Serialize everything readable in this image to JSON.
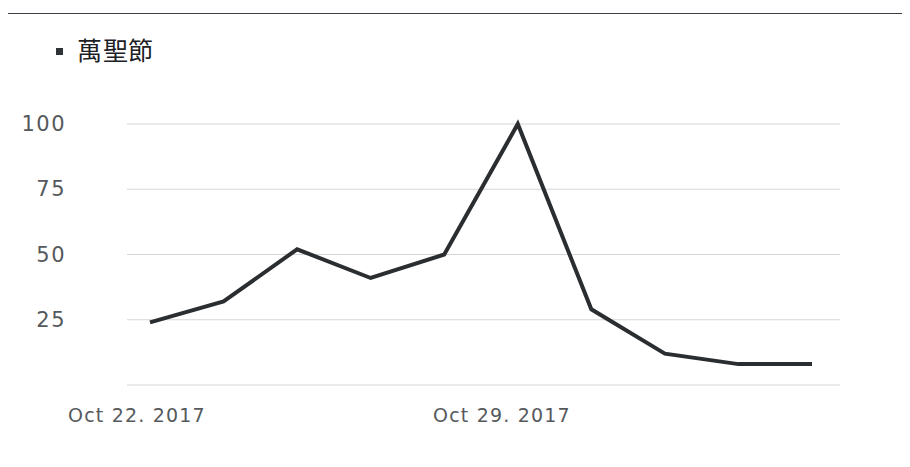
{
  "legend": {
    "marker_icon": "square-marker-icon",
    "label": "萬聖節",
    "color": "#2f3336"
  },
  "axis": {
    "y_ticks": [
      "100",
      "75",
      "50",
      "25"
    ],
    "x_ticks": [
      "Oct 22. 2017",
      "Oct 29. 2017"
    ]
  },
  "chart_data": {
    "type": "line",
    "title": "",
    "subtitle": "",
    "xlabel": "",
    "ylabel": "",
    "ylim": [
      0,
      107
    ],
    "xlim": [
      0,
      9
    ],
    "grid": true,
    "grid_axis": "y",
    "legend_position": "top-left",
    "yticks": [
      0,
      25,
      50,
      75,
      100
    ],
    "ytick_labels_shown": [
      "100",
      "75",
      "50",
      "25"
    ],
    "xtick_labels": [
      "Oct 22. 2017",
      "Oct 29. 2017"
    ],
    "xtick_positions": [
      0,
      5
    ],
    "line_color": "#2b2e30",
    "line_width": 4,
    "series": [
      {
        "name": "萬聖節",
        "x": [
          0,
          1,
          2,
          3,
          4,
          5,
          6,
          7,
          8,
          9
        ],
        "values": [
          24,
          32,
          52,
          41,
          50,
          100,
          29,
          12,
          8,
          8
        ]
      }
    ]
  }
}
